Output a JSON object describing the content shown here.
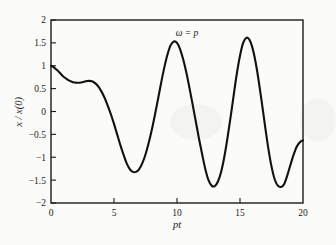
{
  "chart_data": {
    "type": "line",
    "title": "",
    "annotation": "ω = p",
    "xlabel": "pt",
    "ylabel": "x / x(0)",
    "xlim": [
      0,
      20
    ],
    "ylim": [
      -2,
      2
    ],
    "xticks": [
      0,
      5,
      10,
      15,
      20
    ],
    "xtick_labels": [
      "0",
      "5",
      "10",
      "15",
      "20"
    ],
    "yticks": [
      2,
      1.5,
      1,
      0.5,
      0,
      -0.5,
      -1,
      -1.5,
      -2
    ],
    "ytick_labels": [
      "2",
      "1.5",
      "1",
      "0.5",
      "0",
      "−0.5",
      "−1",
      "−1.5",
      "−2"
    ],
    "grid": false,
    "legend": null,
    "line_color": "#111111",
    "series": [
      {
        "name": "x / x(0)",
        "x": [
          0.0,
          0.25,
          0.5,
          0.75,
          1.0,
          1.25,
          1.5,
          1.75,
          2.0,
          2.25,
          2.5,
          2.75,
          3.0,
          3.25,
          3.5,
          3.75,
          4.0,
          4.25,
          4.5,
          4.75,
          5.0,
          5.25,
          5.5,
          5.75,
          6.0,
          6.25,
          6.5,
          6.75,
          7.0,
          7.25,
          7.5,
          7.75,
          8.0,
          8.25,
          8.5,
          8.75,
          9.0,
          9.25,
          9.5,
          9.75,
          10.0,
          10.25,
          10.5,
          10.75,
          11.0,
          11.25,
          11.5,
          11.75,
          12.0,
          12.25,
          12.5,
          12.75,
          13.0,
          13.25,
          13.5,
          13.75,
          14.0,
          14.25,
          14.5,
          14.75,
          15.0,
          15.25,
          15.5,
          15.75,
          16.0,
          16.25,
          16.5,
          16.75,
          17.0,
          17.25,
          17.5,
          17.75,
          18.0,
          18.25,
          18.5,
          18.75,
          19.0,
          19.25,
          19.5,
          19.75,
          20.0
        ],
        "y": [
          1.0,
          0.96,
          0.9,
          0.83,
          0.76,
          0.71,
          0.67,
          0.64,
          0.63,
          0.63,
          0.64,
          0.66,
          0.67,
          0.66,
          0.62,
          0.55,
          0.44,
          0.3,
          0.13,
          -0.06,
          -0.27,
          -0.5,
          -0.73,
          -0.94,
          -1.13,
          -1.26,
          -1.32,
          -1.32,
          -1.26,
          -1.13,
          -0.94,
          -0.69,
          -0.4,
          -0.07,
          0.28,
          0.64,
          0.97,
          1.25,
          1.45,
          1.53,
          1.5,
          1.36,
          1.13,
          0.84,
          0.5,
          0.14,
          -0.23,
          -0.6,
          -0.94,
          -1.26,
          -1.5,
          -1.62,
          -1.63,
          -1.53,
          -1.32,
          -1.0,
          -0.59,
          -0.13,
          0.36,
          0.83,
          1.22,
          1.5,
          1.61,
          1.57,
          1.38,
          1.06,
          0.64,
          0.16,
          -0.34,
          -0.81,
          -1.2,
          -1.48,
          -1.62,
          -1.65,
          -1.59,
          -1.4,
          -1.17,
          -0.95,
          -0.77,
          -0.67,
          -0.63
        ]
      }
    ],
    "key_points": {
      "start": [
        0,
        1.0
      ],
      "local_min_1": [
        2.1,
        0.63
      ],
      "local_max_1": [
        3.0,
        0.67
      ],
      "trough_1": [
        6.1,
        -1.32
      ],
      "peak_1": [
        9.4,
        1.53
      ],
      "trough_2": [
        12.6,
        -1.63
      ],
      "peak_2": [
        15.55,
        1.61
      ],
      "trough_3": [
        18.7,
        -1.65
      ],
      "end": [
        20,
        -0.63
      ]
    }
  }
}
